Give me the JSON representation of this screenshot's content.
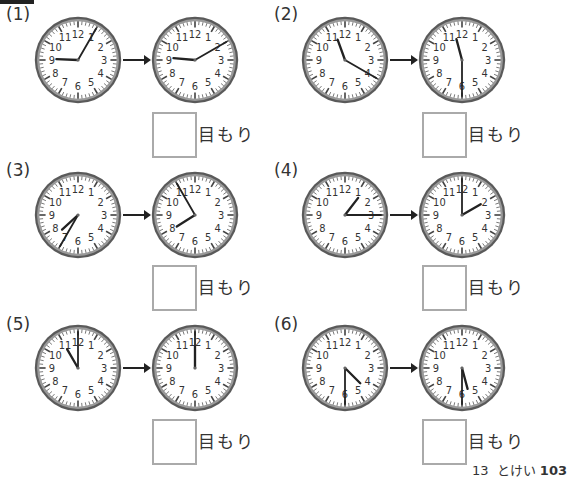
{
  "problems": [
    {
      "label": "(1)",
      "from": {
        "h": 9,
        "m": 5
      },
      "to": {
        "h": 9,
        "m": 10
      },
      "answer": "",
      "unit": "目もり"
    },
    {
      "label": "(2)",
      "from": {
        "h": 11,
        "m": 20
      },
      "to": {
        "h": 11,
        "m": 30
      },
      "answer": "",
      "unit": "目もり"
    },
    {
      "label": "(3)",
      "from": {
        "h": 7,
        "m": 35
      },
      "to": {
        "h": 7,
        "m": 55
      },
      "answer": "",
      "unit": "目もり"
    },
    {
      "label": "(4)",
      "from": {
        "h": 1,
        "m": 15
      },
      "to": {
        "h": 2,
        "m": 0
      },
      "answer": "",
      "unit": "目もり"
    },
    {
      "label": "(5)",
      "from": {
        "h": 11,
        "m": 0
      },
      "to": {
        "h": 12,
        "m": 0
      },
      "answer": "",
      "unit": "目もり"
    },
    {
      "label": "(6)",
      "from": {
        "h": 4,
        "m": 30
      },
      "to": {
        "h": 5,
        "m": 30
      },
      "answer": "",
      "unit": "目もり"
    }
  ],
  "clock_numbers": [
    "12",
    "1",
    "2",
    "3",
    "4",
    "5",
    "6",
    "7",
    "8",
    "9",
    "10",
    "11"
  ],
  "footer": {
    "chapter": "13",
    "title": "とけい",
    "page": "103"
  },
  "colors": {
    "rim": "#5a5a5a",
    "rim_light": "#9a9a9a",
    "hand": "#222222",
    "box_border": "#aaaaaa"
  }
}
